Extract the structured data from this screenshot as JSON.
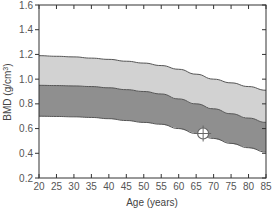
{
  "chart_data": {
    "type": "area",
    "title": "",
    "xlabel": "Age (years)",
    "ylabel": "BMD (g/cm³)",
    "ylabel_base": "BMD (g/cm",
    "ylabel_sup": "3",
    "ylabel_close": ")",
    "xlim": [
      20,
      85
    ],
    "ylim": [
      0.2,
      1.6
    ],
    "x_ticks": [
      20,
      25,
      30,
      35,
      40,
      45,
      50,
      55,
      60,
      65,
      70,
      75,
      80,
      85
    ],
    "y_ticks": [
      0.2,
      0.4,
      0.6,
      0.8,
      1.0,
      1.2,
      1.4,
      1.6
    ],
    "y_tick_labels": [
      "0.2",
      "0.4",
      "0.6",
      "0.8",
      "1.0",
      "1.2",
      "1.4",
      "1.6"
    ],
    "grid": false,
    "legend": null,
    "x": [
      20,
      25,
      30,
      35,
      40,
      45,
      50,
      55,
      60,
      65,
      70,
      75,
      80,
      85
    ],
    "series": [
      {
        "name": "upper reference (+1 SD)",
        "values": [
          1.19,
          1.185,
          1.18,
          1.17,
          1.16,
          1.145,
          1.13,
          1.11,
          1.08,
          1.04,
          1.0,
          0.97,
          0.94,
          0.91
        ]
      },
      {
        "name": "mean reference",
        "values": [
          0.95,
          0.948,
          0.945,
          0.94,
          0.93,
          0.915,
          0.9,
          0.88,
          0.84,
          0.8,
          0.76,
          0.72,
          0.685,
          0.65
        ]
      },
      {
        "name": "lower reference (-1 SD)",
        "values": [
          0.7,
          0.698,
          0.695,
          0.69,
          0.68,
          0.665,
          0.65,
          0.635,
          0.6,
          0.56,
          0.52,
          0.48,
          0.445,
          0.41
        ]
      }
    ],
    "bands": [
      {
        "name": "upper band",
        "between": [
          "upper reference (+1 SD)",
          "mean reference"
        ],
        "color": "#d2d2d2"
      },
      {
        "name": "lower band",
        "between": [
          "mean reference",
          "lower reference (-1 SD)"
        ],
        "color": "#8f8f8f"
      }
    ],
    "annotations": [
      {
        "type": "patient-marker",
        "x": 67,
        "y": 0.56,
        "shape": "circle-crosshair"
      }
    ]
  },
  "colors": {
    "light_band": "#d2d2d2",
    "dark_band": "#8f8f8f",
    "curve": "#555555",
    "axis": "#333333",
    "marker_fill": "#ffffff",
    "marker_stroke": "#666666"
  }
}
